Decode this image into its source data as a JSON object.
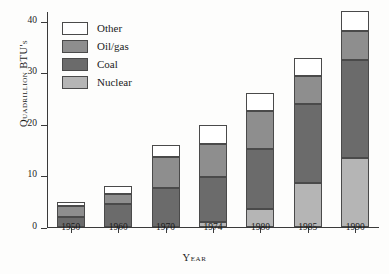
{
  "chart_data": {
    "type": "bar",
    "stacked": true,
    "title": "",
    "xlabel": "Year",
    "ylabel": "Quadrillion BTU's",
    "categories": [
      "1950",
      "1960",
      "1970",
      "1974",
      "1980",
      "1985",
      "1990"
    ],
    "ylim": [
      0,
      42
    ],
    "yticks": [
      0,
      10,
      20,
      30,
      40
    ],
    "ytick_labels": [
      "0",
      "10",
      "20",
      "30",
      "40"
    ],
    "grid": false,
    "legend_position": "top-left",
    "series": [
      {
        "name": "Nuclear",
        "color": "#b5b5b5",
        "values": [
          0,
          0,
          0,
          1.0,
          3.5,
          8.5,
          13.4
        ]
      },
      {
        "name": "Coal",
        "color": "#6b6b6b",
        "values": [
          2.0,
          4.5,
          7.5,
          9.7,
          15.1,
          23.9,
          32.4
        ]
      },
      {
        "name": "Oil/gas",
        "color": "#8e8e8e",
        "values": [
          4.1,
          6.4,
          13.6,
          16.2,
          22.5,
          29.4,
          38.1
        ]
      },
      {
        "name": "Other",
        "color": "#ffffff",
        "values": [
          4.8,
          7.9,
          15.9,
          19.8,
          26.0,
          32.9,
          42.0
        ]
      }
    ],
    "series_are_cumulative_tops": true,
    "totals": [
      4.8,
      7.9,
      15.9,
      19.8,
      26.0,
      32.9,
      42.0
    ]
  },
  "legend": {
    "items": [
      {
        "label": "Other",
        "swatch": "other"
      },
      {
        "label": "Oil/gas",
        "swatch": "oilgas"
      },
      {
        "label": "Coal",
        "swatch": "coal"
      },
      {
        "label": "Nuclear",
        "swatch": "nuclear"
      }
    ]
  },
  "axes": {
    "y_title": "Quadrillion BTU's",
    "x_title": "Year"
  }
}
